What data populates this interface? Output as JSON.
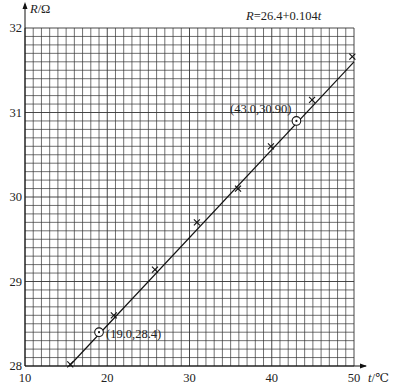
{
  "chart_data": {
    "type": "scatter",
    "title": "R=26.4+0.104t",
    "xlabel": "t/℃",
    "ylabel": "R/Ω",
    "xlim": [
      10,
      50
    ],
    "ylim": [
      28,
      32
    ],
    "x_ticks": [
      10,
      20,
      30,
      40,
      50
    ],
    "y_ticks": [
      28,
      29,
      30,
      31,
      32
    ],
    "grid": true,
    "grid_minor_x_step": 1,
    "grid_minor_y_step": 0.1,
    "fit_line": {
      "intercept": 26.4,
      "slope": 0.104,
      "label": "R=26.4+0.104t"
    },
    "series": [
      {
        "name": "measured",
        "marker": "x",
        "points": [
          {
            "x": 15.5,
            "y": 28.02
          },
          {
            "x": 20.8,
            "y": 28.6
          },
          {
            "x": 25.8,
            "y": 29.14
          },
          {
            "x": 30.9,
            "y": 29.7
          },
          {
            "x": 35.9,
            "y": 30.1
          },
          {
            "x": 39.9,
            "y": 30.6
          },
          {
            "x": 44.9,
            "y": 31.15
          },
          {
            "x": 49.8,
            "y": 31.66
          }
        ]
      },
      {
        "name": "selected",
        "marker": "circle",
        "points": [
          {
            "x": 19.0,
            "y": 28.4,
            "label": "(19.0,28.4)"
          },
          {
            "x": 43.0,
            "y": 30.9,
            "label": "(43.0,30.90)"
          }
        ]
      }
    ]
  },
  "labels": {
    "equation": "R=26.4+0.104t",
    "y_axis": "R/Ω",
    "x_axis": "t/℃",
    "point1": "(19.0,28.4)",
    "point2": "(43.0,30.90)"
  }
}
